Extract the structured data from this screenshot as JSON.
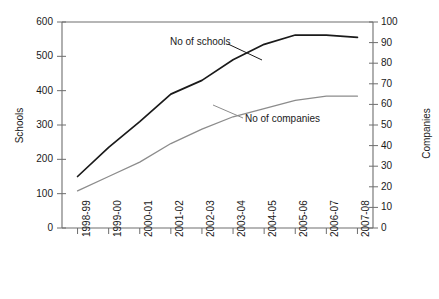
{
  "chart_data": {
    "type": "line",
    "title": "",
    "xlabel": "",
    "ylabel": "Schools",
    "y2label": "Companies",
    "grid": false,
    "legend_position": "inline-annotation",
    "categories": [
      "1998-99",
      "1999-00",
      "2000-01",
      "2001-02",
      "2002-03",
      "2003-04",
      "2004-05",
      "2005-06",
      "2006-07",
      "2007-08"
    ],
    "ylim": [
      0,
      600
    ],
    "y2lim": [
      0,
      100
    ],
    "yticks": [
      0,
      100,
      200,
      300,
      400,
      500,
      600
    ],
    "y2ticks": [
      0,
      10,
      20,
      30,
      40,
      50,
      60,
      70,
      80,
      90,
      100
    ],
    "series": [
      {
        "name": "No of schools",
        "axis": "left",
        "color": "#1a1a1a",
        "values": [
          150,
          235,
          310,
          390,
          430,
          490,
          535,
          562,
          562,
          555
        ]
      },
      {
        "name": "No of companies",
        "axis": "right",
        "color": "#8c8c8c",
        "values": [
          18,
          25,
          32,
          41,
          48,
          54,
          58,
          62,
          64,
          64
        ]
      }
    ]
  },
  "axes": {
    "left_title": "Schools",
    "right_title": "Companies",
    "left_ticks": [
      "0",
      "100",
      "200",
      "300",
      "400",
      "500",
      "600"
    ],
    "right_ticks": [
      "0",
      "10",
      "20",
      "30",
      "40",
      "50",
      "60",
      "70",
      "80",
      "90",
      "100"
    ],
    "x_ticks": [
      "1998-99",
      "1999-00",
      "2000-01",
      "2001-02",
      "2002-03",
      "2003-04",
      "2004-05",
      "2005-06",
      "2006-07",
      "2007-08"
    ]
  },
  "annotations": {
    "schools_label": "No of schools",
    "companies_label": "No of companies"
  },
  "colors": {
    "schools_line": "#1a1a1a",
    "companies_line": "#8c8c8c",
    "axis": "#6e6e6e",
    "text": "#1a1a1a",
    "background": "#ffffff"
  }
}
